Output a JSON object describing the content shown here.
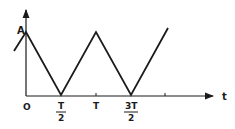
{
  "diagram": {
    "type": "triangle-wave",
    "y_axis_label": "A",
    "x_axis_label": "t",
    "x_ticks": [
      {
        "label": "O"
      },
      {
        "numerator": "T",
        "denominator": "2"
      },
      {
        "label": "T"
      },
      {
        "numerator": "3T",
        "denominator": "2"
      },
      {
        "label": ""
      }
    ],
    "colors": {
      "line": "#1a1a1a",
      "background": "#ffffff"
    }
  }
}
